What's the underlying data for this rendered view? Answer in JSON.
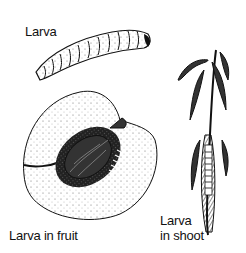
{
  "labels": {
    "larva": "Larva",
    "larva_in_fruit": "Larva in fruit",
    "larva_in_shoot_line1": "Larva",
    "larva_in_shoot_line2": "in shoot"
  },
  "colors": {
    "ink": "#111111",
    "background": "#ffffff"
  }
}
